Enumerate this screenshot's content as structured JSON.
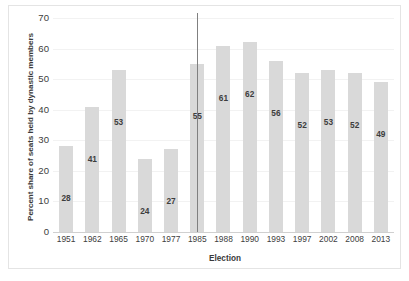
{
  "chart_data": {
    "type": "bar",
    "title": "",
    "xlabel": "Election",
    "ylabel": "Percent share of seats held by dynastic members",
    "categories": [
      "1951",
      "1962",
      "1965",
      "1970",
      "1977",
      "1985",
      "1988",
      "1990",
      "1993",
      "1997",
      "2002",
      "2008",
      "2013"
    ],
    "values": [
      28,
      41,
      53,
      24,
      27,
      55,
      61,
      62,
      56,
      52,
      53,
      52,
      49
    ],
    "value_labels": [
      "28",
      "41",
      "53",
      "24",
      "27",
      "55",
      "61",
      "62",
      "56",
      "52",
      "53",
      "52",
      "49"
    ],
    "ylim": [
      0,
      70
    ],
    "ytick_values": [
      0,
      10,
      20,
      30,
      40,
      50,
      60,
      70
    ],
    "ytick_labels": [
      "0",
      "10",
      "20",
      "30",
      "40",
      "50",
      "60",
      "70"
    ],
    "ytick_step": 10,
    "grid": true,
    "grid_axis": "y",
    "legend": "none",
    "bar_color": "#d9d9d9",
    "label_color": "#3d3d3d",
    "gridline_color": "#f2f2f2",
    "axis_color": "#d0d0d0",
    "border_color": "#e4e4e4",
    "background_color": "#ffffff",
    "annotations": [
      {
        "name": "reference-line",
        "type": "vertical-line",
        "at_category": "1985",
        "color": "#808080",
        "label": ""
      }
    ]
  }
}
